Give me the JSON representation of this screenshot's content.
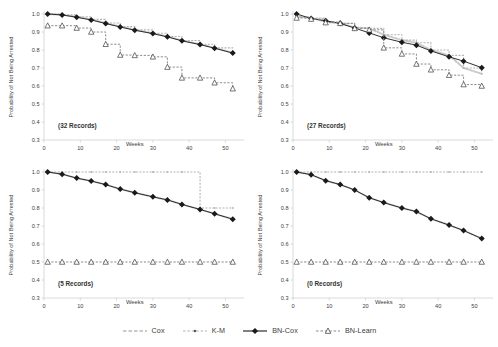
{
  "figure": {
    "type": "survival-curves-small-multiples",
    "panels_layout": "2x2"
  },
  "axes": {
    "ylabel": "Probability of Not Being Arrested",
    "xlabel": "Weeks",
    "yticks": [
      "1.0",
      "0.9",
      "0.8",
      "0.7",
      "0.6",
      "0.5",
      "0.4",
      "0.3"
    ],
    "ytick_values": [
      1.0,
      0.9,
      0.8,
      0.7,
      0.6,
      0.5,
      0.4,
      0.3
    ],
    "xticks": [
      "0",
      "10",
      "20",
      "30",
      "40",
      "50"
    ],
    "xtick_values": [
      0,
      10,
      20,
      30,
      40,
      50
    ],
    "ylim": [
      0.3,
      1.0
    ],
    "xlim": [
      0,
      54
    ]
  },
  "legend": {
    "position": "bottom-center",
    "items": [
      {
        "label": "Cox",
        "marker": "none",
        "style": "dashed",
        "color": "#c9c9c9"
      },
      {
        "label": "K-M",
        "marker": "square",
        "style": "dashed",
        "color": "#b4b4b4"
      },
      {
        "label": "BN-Cox",
        "marker": "diamond",
        "style": "solid",
        "color": "#1a1a1a"
      },
      {
        "label": "BN-Learn",
        "marker": "triangle",
        "style": "dashed",
        "color": "#8c8c8c"
      }
    ]
  },
  "colors": {
    "cox": "#c9c9c9",
    "km": "#b4b4b4",
    "bncox": "#1a1a1a",
    "bnlearn": "#8c8c8c",
    "axis": "#d0d0d0",
    "text": "#404040"
  },
  "chart_data": [
    {
      "type": "line",
      "panel": "top-left",
      "title": "(32 Records)",
      "annotation": "(32 Records)",
      "xlabel": "Weeks",
      "ylabel": "Probability of Not Being Arrested",
      "xlim": [
        0,
        54
      ],
      "ylim": [
        0.3,
        1.0
      ],
      "grid": false,
      "x": [
        1,
        5,
        9,
        13,
        17,
        21,
        25,
        30,
        34,
        38,
        43,
        47,
        52
      ],
      "series": [
        {
          "name": "Cox",
          "values": [
            1.0,
            0.995,
            0.985,
            0.97,
            0.95,
            0.93,
            0.912,
            0.893,
            0.875,
            0.853,
            0.832,
            0.812,
            0.785
          ]
        },
        {
          "name": "K-M",
          "values": [
            1.0,
            0.995,
            0.985,
            0.97,
            0.95,
            0.93,
            0.912,
            0.893,
            0.875,
            0.853,
            0.832,
            0.812,
            0.785
          ]
        },
        {
          "name": "BN-Cox",
          "values": [
            1.0,
            0.995,
            0.982,
            0.967,
            0.947,
            0.928,
            0.91,
            0.891,
            0.873,
            0.851,
            0.83,
            0.81,
            0.783
          ]
        },
        {
          "name": "BN-Learn",
          "values": [
            0.935,
            0.935,
            0.922,
            0.9,
            0.832,
            0.772,
            0.77,
            0.762,
            0.705,
            0.645,
            0.645,
            0.618,
            0.585
          ]
        }
      ]
    },
    {
      "type": "line",
      "panel": "top-right",
      "title": "(27 Records)",
      "annotation": "(27 Records)",
      "xlabel": "Weeks",
      "ylabel": "Probability of Not Being Arrested",
      "xlim": [
        0,
        54
      ],
      "ylim": [
        0.3,
        1.0
      ],
      "grid": false,
      "x": [
        1,
        5,
        9,
        13,
        17,
        21,
        25,
        30,
        34,
        38,
        43,
        47,
        52
      ],
      "series": [
        {
          "name": "Cox",
          "values": [
            0.985,
            0.978,
            0.957,
            0.948,
            0.925,
            0.92,
            0.885,
            0.855,
            0.84,
            0.8,
            0.77,
            0.7,
            0.668
          ]
        },
        {
          "name": "K-M",
          "values": [
            0.985,
            0.978,
            0.957,
            0.948,
            0.925,
            0.92,
            0.885,
            0.855,
            0.84,
            0.8,
            0.77,
            0.7,
            0.668
          ]
        },
        {
          "name": "BN-Cox",
          "values": [
            1.0,
            0.975,
            0.962,
            0.948,
            0.922,
            0.895,
            0.868,
            0.843,
            0.827,
            0.795,
            0.762,
            0.738,
            0.702
          ]
        },
        {
          "name": "BN-Learn",
          "values": [
            0.978,
            0.972,
            0.952,
            0.948,
            0.92,
            0.912,
            0.812,
            0.778,
            0.722,
            0.69,
            0.66,
            0.608,
            0.6
          ]
        }
      ]
    },
    {
      "type": "line",
      "panel": "bottom-left",
      "title": "(5 Records)",
      "annotation": "(5 Records)",
      "xlabel": "Weeks",
      "ylabel": "Probability of Not Being Arrested",
      "xlim": [
        0,
        54
      ],
      "ylim": [
        0.3,
        1.0
      ],
      "grid": false,
      "x": [
        1,
        5,
        9,
        13,
        17,
        21,
        25,
        30,
        34,
        38,
        43,
        47,
        52
      ],
      "series": [
        {
          "name": "Cox",
          "values": [
            1.0,
            0.988,
            0.966,
            0.95,
            0.93,
            0.905,
            0.885,
            0.862,
            0.845,
            0.82,
            0.792,
            0.768,
            0.738
          ]
        },
        {
          "name": "K-M",
          "values": [
            1.0,
            1.0,
            1.0,
            1.0,
            1.0,
            1.0,
            1.0,
            1.0,
            1.0,
            1.0,
            0.8,
            0.8,
            0.8
          ]
        },
        {
          "name": "BN-Cox",
          "values": [
            1.0,
            0.988,
            0.966,
            0.95,
            0.93,
            0.905,
            0.885,
            0.862,
            0.845,
            0.82,
            0.792,
            0.768,
            0.738
          ]
        },
        {
          "name": "BN-Learn",
          "values": [
            0.5,
            0.5,
            0.5,
            0.5,
            0.5,
            0.5,
            0.5,
            0.5,
            0.5,
            0.5,
            0.5,
            0.5,
            0.5
          ]
        }
      ]
    },
    {
      "type": "line",
      "panel": "bottom-right",
      "title": "(0 Records)",
      "annotation": "(0 Records)",
      "xlabel": "Weeks",
      "ylabel": "Probability of Not Being Arrested",
      "xlim": [
        0,
        54
      ],
      "ylim": [
        0.3,
        1.0
      ],
      "grid": false,
      "x": [
        1,
        5,
        9,
        13,
        17,
        21,
        25,
        30,
        34,
        38,
        43,
        47,
        52
      ],
      "series": [
        {
          "name": "Cox",
          "values": [
            1.0,
            0.985,
            0.952,
            0.93,
            0.9,
            0.857,
            0.83,
            0.8,
            0.78,
            0.74,
            0.705,
            0.675,
            0.63
          ]
        },
        {
          "name": "K-M",
          "values": [
            1.0,
            1.0,
            1.0,
            1.0,
            1.0,
            1.0,
            1.0,
            1.0,
            1.0,
            1.0,
            1.0,
            1.0,
            1.0
          ]
        },
        {
          "name": "BN-Cox",
          "values": [
            1.0,
            0.985,
            0.952,
            0.93,
            0.9,
            0.857,
            0.83,
            0.8,
            0.78,
            0.74,
            0.705,
            0.675,
            0.63
          ]
        },
        {
          "name": "BN-Learn",
          "values": [
            0.5,
            0.5,
            0.5,
            0.5,
            0.5,
            0.5,
            0.5,
            0.5,
            0.5,
            0.5,
            0.5,
            0.5,
            0.5
          ]
        }
      ]
    }
  ]
}
